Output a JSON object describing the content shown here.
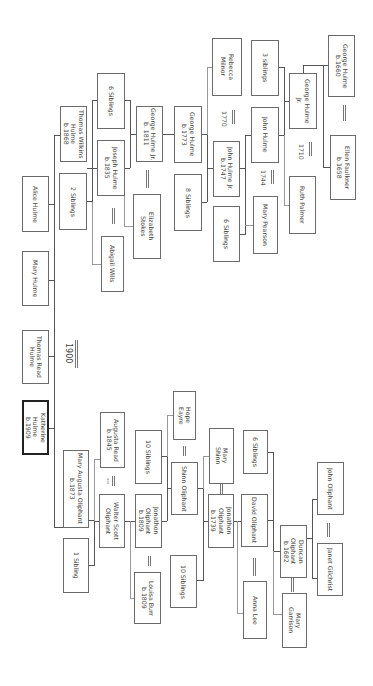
{
  "diagram": {
    "type": "family-tree",
    "orientation": "rotated-90-clockwise",
    "focus_person": "Katherine Hulme b.1909"
  },
  "people": {
    "alice_hulme": "Alice Hulme",
    "mary_hulme": "Mary Hulme",
    "thomas_read_hulme": "Thomas Read\nHulme",
    "katherine_hulme": "Katherine Hulme\nb.1909",
    "thomas_wilkins_hulme": "Thomas Wilkins\nHulme\nb.1868",
    "two_siblings": "2 Siblings",
    "mary_augusta_oliphant": "Mary Augusta Oliphant\nb.1873",
    "one_sibling": "1 Sibling",
    "six_siblings_a": "6 Siblings",
    "joseph_hulme": "Joseph Hulme\nb.1835",
    "abigail_wills": "Abigail Wills",
    "augusta_read": "Augusta Read\nb.1845",
    "walter_scott_oliphant": "Walter Scott\nOliphant",
    "george_hulme_jr_1811": "George Hulme Jr.\nb. 1811",
    "elizabeth_stokes": "Elizabeth\nStokes",
    "ten_siblings_a": "10 Siblings",
    "jonathon_oliphant_1809": "Jonathon\nOliphant\nb.1809",
    "louisa_burr": "Louisa Burr\nb.1809",
    "george_hulme_1773": "George Hulme\nb.1773",
    "eight_siblings": "8 Siblings",
    "hope_eayre": "Hope\nEayre",
    "shinn_oliphant": "Shinn Oliphant",
    "ten_siblings_b": "10 Siblings",
    "rebecca_milnor": "Rebecca\nMilnor",
    "john_hulme_jr": "John Hulme Jr.\nb.1747",
    "six_siblings_b": "6 Siblings",
    "mary_shinn": "Mary\nShinn",
    "jonathon_oliphant_1739": "Jonathon\nOliphant\nb.1739",
    "three_siblings": "3 siblings",
    "john_hulme": "John Hulme",
    "mary_pearson": "Mary Pearson",
    "six_siblings_c": "6 Siblings",
    "david_oliphant": "David Oliphant",
    "anna_lee": "Anna Lee",
    "george_hulme_jr": "George Hulme\nJr.",
    "ruth_palmer": "Ruth Palmer",
    "duncan_oliphant": "Duncan Oliphant\nb.1682",
    "mary_garrison": "Mary\nGarrison",
    "george_hulme_1660": "George Hulme\nb.1660",
    "ellen_faulkner": "Ellen Faulkner\nb.1658",
    "john_oliphant": "John Oliphant",
    "janet_gilchrist": "Janet Gilchrist"
  },
  "marriages": {
    "y1900": "1900",
    "y1770": "1770",
    "y1744": "1744",
    "y1710": "1710",
    "usa_note": "usa"
  }
}
